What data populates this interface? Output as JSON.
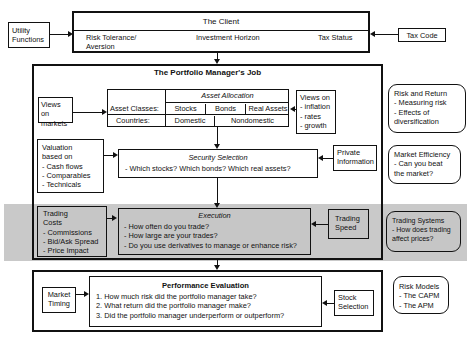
{
  "client": {
    "title": "The Client",
    "fields": [
      "Risk Tolerance/\nAversion",
      "Investment Horizon",
      "Tax Status"
    ],
    "risk_tolerance_line1": "Risk Tolerance/",
    "risk_tolerance_line2": "Aversion",
    "investment_horizon": "Investment Horizon",
    "tax_status": "Tax Status"
  },
  "utility_functions": {
    "line1": "Utility",
    "line2": "Functions"
  },
  "tax_code": "Tax Code",
  "pm_job": {
    "title": "The Portfolio Manager's Job",
    "asset_allocation": {
      "title": "Asset Allocation",
      "row1_label": "Asset Classes:",
      "row1_values": [
        "Stocks",
        "Bonds",
        "Real Assets"
      ],
      "row2_label": "Countries:",
      "row2_values": [
        "Domestic",
        "Nondomestic"
      ]
    },
    "views_on_markets": {
      "line1": "Views on",
      "line2": "markets"
    },
    "views_on_macro": {
      "lines": [
        "Views on",
        "- inflation",
        "- rates",
        "- growth"
      ]
    },
    "valuation": {
      "lines": [
        "Valuation",
        "based on",
        "- Cash flows",
        "- Comparables",
        "- Technicals"
      ]
    },
    "security_selection": {
      "title": "Security Selection",
      "text": "- Which stocks? Which bonds? Which real assets?"
    },
    "private_information": {
      "line1": "Private",
      "line2": "Information"
    },
    "trading_costs": {
      "lines": [
        "Trading",
        "Costs",
        "- Commissions",
        "- Bid/Ask Spread",
        "- Price Impact"
      ]
    },
    "execution": {
      "title": "Execution",
      "lines": [
        "- How often do you trade?",
        "- How large are your trades?",
        "- Do you use derivatives to manage or enhance risk?"
      ]
    },
    "trading_speed": {
      "line1": "Trading",
      "line2": "Speed"
    }
  },
  "performance": {
    "title": "Performance Evaluation",
    "lines": [
      "1. How much risk did the portfolio manager take?",
      "2. What return did the portfolio manager make?",
      "3. Did the portfolio manager underperform or outperform?"
    ],
    "market_timing": {
      "line1": "Market",
      "line2": "Timing"
    },
    "stock_selection": {
      "line1": "Stock",
      "line2": "Selection"
    }
  },
  "side_notes": {
    "risk_return": {
      "lines": [
        "Risk and Return",
        "- Measuring risk",
        "- Effects of",
        "diversification"
      ]
    },
    "market_efficiency": {
      "lines": [
        "Market Efficiency",
        "- Can you beat",
        "the market?"
      ]
    },
    "trading_systems": {
      "lines": [
        "Trading Systems",
        "- How does trading",
        "affect prices?"
      ]
    },
    "risk_models": {
      "lines": [
        "Risk Models",
        "- The CAPM",
        "- The APM"
      ]
    }
  },
  "colors": {
    "band_gray": "#c9c9c9",
    "box_gray": "#c6c6c6",
    "line": "#111111"
  }
}
